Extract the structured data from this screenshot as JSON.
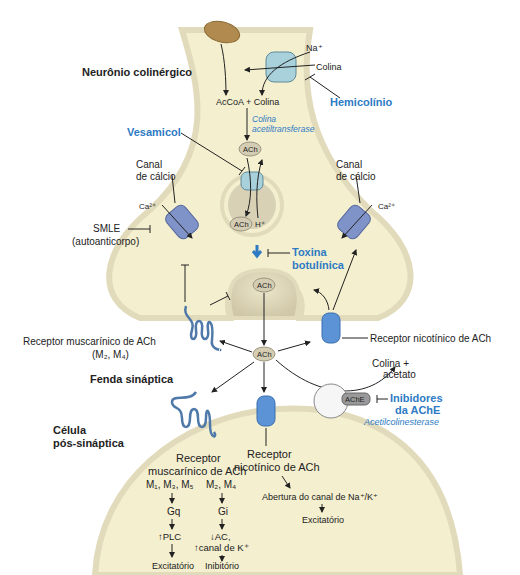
{
  "labels": {
    "presynaptic_title": "Neurônio colinérgico",
    "na": "Na⁺",
    "choline_in": "Colina",
    "hemicholinium": "Hemicolínio",
    "acoa_choline": "AcCoA + Colina",
    "chat_line1": "Colina",
    "chat_line2": "acetiltransferase",
    "vesamicol": "Vesamicol",
    "ach": "ACh",
    "h_plus": "H⁺",
    "ca_channel_left_1": "Canal",
    "ca_channel_left_2": "de cálcio",
    "ca_channel_right_1": "Canal",
    "ca_channel_right_2": "de cálcio",
    "ca_left": "Ca²⁺",
    "ca_right": "Ca²⁺",
    "smle_1": "SMLE",
    "smle_2": "(autoanticorpo)",
    "botulinum_1": "Toxina",
    "botulinum_2": "botulínica",
    "musc_pre_1": "Receptor muscarínico de ACh",
    "musc_pre_2": "(M₂, M₄)",
    "nic_pre": "Receptor nicotínico de ACh",
    "cleft_title": "Fenda sináptica",
    "choline_acetate_1": "Colina +",
    "choline_acetate_2": "acetato",
    "ache": "AChE",
    "ache_inhib_1": "Inibidores",
    "ache_inhib_2": "da AChE",
    "ache_full": "Acetilcolinesterase",
    "post_title_1": "Célula",
    "post_title_2": "pós-sináptica",
    "musc_post_1": "Receptor",
    "musc_post_2": "muscarínico de ACh",
    "m135": "M₁, M₃, M₅",
    "m24": "M₂, M₄",
    "gq": "Gq",
    "gi": "Gi",
    "plc": "↑PLC",
    "ac": "↓AC,",
    "kchan": "↑canal de K⁺",
    "excit_left": "Excitatório",
    "inhib": "Inibitório",
    "nic_post_1": "Receptor",
    "nic_post_2": "nicotínico de ACh",
    "na_k_open": "Abertura do canal de Na⁺/K⁺",
    "excit_right": "Excitatório"
  },
  "colors": {
    "cytoplasm": "#f4efcf",
    "membrane": "#e6dfc0",
    "drug_blue": "#2e7bc4",
    "channel_blue": "#7f93c9",
    "transporter": "#a9d1dc",
    "receptor_blue": "#5b93d6",
    "mitochondrion": "#b08a4e"
  }
}
